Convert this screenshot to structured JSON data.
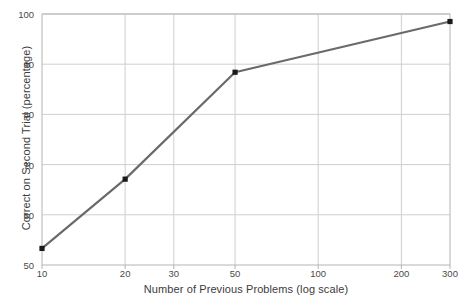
{
  "chart_data": {
    "type": "line",
    "title": "",
    "subtitle": "",
    "xlabel": "Number of Previous Problems (log scale)",
    "ylabel": "Correct on Second Trial (percentage)",
    "x_scale": "log",
    "x": [
      10,
      20,
      50,
      300
    ],
    "values": [
      53.3,
      67.1,
      88.4,
      98.5
    ],
    "series": [
      {
        "name": "Correct on Second Trial",
        "x": [
          10,
          20,
          50,
          300
        ],
        "values": [
          53.3,
          67.1,
          88.4,
          98.5
        ],
        "color": "#6a6a6a",
        "marker": "square",
        "marker_color": "#1a1a1a"
      }
    ],
    "xlim": [
      10,
      300
    ],
    "ylim": [
      50,
      100
    ],
    "xticks": [
      10,
      20,
      30,
      50,
      100,
      200,
      300
    ],
    "xtick_labels": [
      "10",
      "20",
      "30",
      "50",
      "100",
      "200",
      "300"
    ],
    "yticks": [
      50,
      60,
      70,
      80,
      90,
      100
    ],
    "ytick_labels": [
      "50",
      "60",
      "70",
      "80",
      "90",
      "100"
    ],
    "grid": true,
    "grid_color": "#cfcfcf",
    "legend": null,
    "legend_position": "none",
    "axis_color": "#b4b4b4",
    "background": "#ffffff",
    "annotations": []
  },
  "figure": {
    "plot_left": 42,
    "plot_right": 450,
    "plot_top": 14,
    "plot_bottom": 265
  }
}
